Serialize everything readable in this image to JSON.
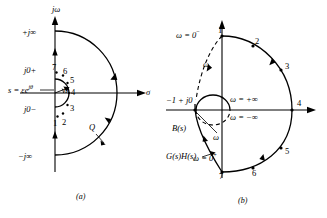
{
  "figure": {
    "panels": [
      {
        "id": "a",
        "caption": "(a)",
        "name": "s-plane-nyquist-contour",
        "axes": {
          "vertical_label": "jω",
          "horizontal_label": "σ"
        },
        "axis_marks": [
          {
            "label": "+j∞",
            "position": "upper-imaginary"
          },
          {
            "label": "j0+",
            "position": "just-above-origin"
          },
          {
            "label": "j0−",
            "position": "just-below-origin"
          },
          {
            "label": "−j∞",
            "position": "lower-imaginary"
          }
        ],
        "annotations": [
          {
            "name": "indentation-equation",
            "text": "s = εe",
            "exponent": "jθ"
          },
          {
            "name": "theta-angle",
            "text": "θ"
          },
          {
            "name": "large-arc",
            "text": "Q"
          }
        ],
        "points": [
          "1",
          "2",
          "3",
          "4",
          "5",
          "6",
          "7"
        ]
      },
      {
        "id": "b",
        "caption": "(b)",
        "name": "gh-plane-nyquist-plot",
        "annotations": [
          {
            "name": "omega-zero-minus",
            "text": "ω = 0",
            "exponent": "−"
          },
          {
            "name": "omega-zero-plus",
            "text": "ω = 0",
            "exponent": "+"
          },
          {
            "name": "omega-plus-infinity",
            "text": "ω = +∞"
          },
          {
            "name": "omega-minus-infinity",
            "text": "ω = −∞"
          },
          {
            "name": "critical-point",
            "text": "−1 + j0"
          },
          {
            "name": "b-of-s",
            "text": "B(s)"
          },
          {
            "name": "g-of-s-h-of-s",
            "text": "G(s)H(s)"
          },
          {
            "name": "omega-upper",
            "text": "ω"
          },
          {
            "name": "omega-lower",
            "text": "ω"
          }
        ],
        "points": [
          "1",
          "2",
          "3",
          "4",
          "5",
          "6",
          "7"
        ]
      }
    ]
  },
  "colors": {
    "ink": "#000000",
    "background": "#ffffff"
  }
}
